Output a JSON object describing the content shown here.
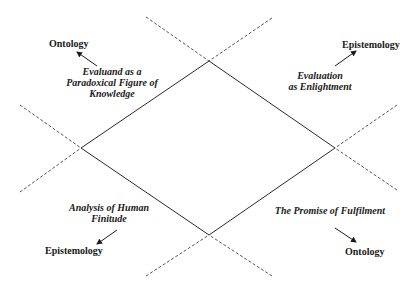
{
  "diagram": {
    "colors": {
      "line": "#2a2a2a",
      "dash": "#555555",
      "text": "#1a1a1a"
    },
    "corner_labels": {
      "top_left": "Ontology",
      "top_right": "Epistemology",
      "bottom_left": "Epistemology",
      "bottom_right": "Ontology"
    },
    "quadrants": {
      "top_left": {
        "line1": "Evaluand as a",
        "line2": "Paradoxical Figure of",
        "line3": "Knowledge"
      },
      "top_right": {
        "line1": "Evaluation",
        "line2": "as Enlightment"
      },
      "bottom_left": {
        "line1": "Analysis of Human",
        "line2": "Finitude"
      },
      "bottom_right": {
        "line1": "The Promise of Fulfilment"
      }
    },
    "vertices": {
      "top": [
        209,
        61
      ],
      "left": [
        81,
        148
      ],
      "right": [
        335,
        148
      ],
      "bottom": [
        209,
        235
      ]
    }
  }
}
